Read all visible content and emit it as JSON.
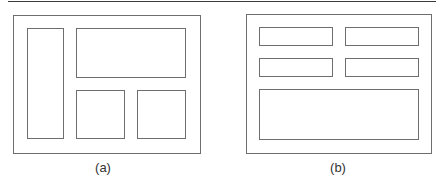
{
  "figure": {
    "panels": [
      {
        "id": "a",
        "caption": "(a)",
        "layout": "sidebar-left with wide top region and two bottom blocks",
        "regions": [
          "outer-frame",
          "left-column",
          "top-wide-block",
          "bottom-middle-block",
          "bottom-right-block"
        ]
      },
      {
        "id": "b",
        "caption": "(b)",
        "layout": "2x2 grid of small blocks above one wide block",
        "regions": [
          "outer-frame",
          "row1-left-block",
          "row1-right-block",
          "row2-left-block",
          "row2-right-block",
          "bottom-wide-block"
        ]
      }
    ],
    "colors": {
      "stroke": "#6e6e6e",
      "rule": "#3a3a3a",
      "background": "#ffffff"
    }
  }
}
